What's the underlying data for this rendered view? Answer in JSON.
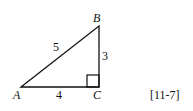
{
  "diagram": {
    "type": "right-triangle",
    "vertices": {
      "A": "A",
      "B": "B",
      "C": "C"
    },
    "sides": {
      "AB": "5",
      "BC": "3",
      "AC": "4"
    },
    "right_angle_at": "C",
    "reference": "[11-7]"
  }
}
